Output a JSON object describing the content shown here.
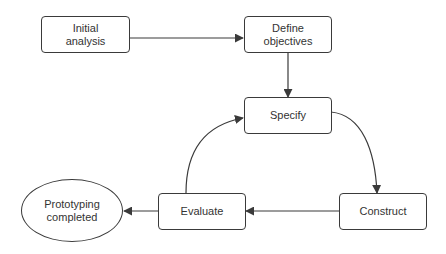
{
  "diagram": {
    "type": "flowchart",
    "colors": {
      "stroke": "#3a3a3a",
      "text": "#333333",
      "background": "#ffffff"
    },
    "nodes": [
      {
        "id": "initial",
        "label": "Initial\nanalysis",
        "shape": "rounded-rect"
      },
      {
        "id": "define",
        "label": "Define\nobjectives",
        "shape": "rounded-rect"
      },
      {
        "id": "specify",
        "label": "Specify",
        "shape": "rounded-rect"
      },
      {
        "id": "construct",
        "label": "Construct",
        "shape": "rounded-rect"
      },
      {
        "id": "evaluate",
        "label": "Evaluate",
        "shape": "rounded-rect"
      },
      {
        "id": "completed",
        "label": "Prototyping\ncompleted",
        "shape": "ellipse"
      }
    ],
    "edges": [
      {
        "from": "initial",
        "to": "define",
        "style": "straight"
      },
      {
        "from": "define",
        "to": "specify",
        "style": "straight"
      },
      {
        "from": "specify",
        "to": "construct",
        "style": "curved"
      },
      {
        "from": "construct",
        "to": "evaluate",
        "style": "straight"
      },
      {
        "from": "evaluate",
        "to": "specify",
        "style": "curved"
      },
      {
        "from": "evaluate",
        "to": "completed",
        "style": "straight"
      }
    ]
  }
}
